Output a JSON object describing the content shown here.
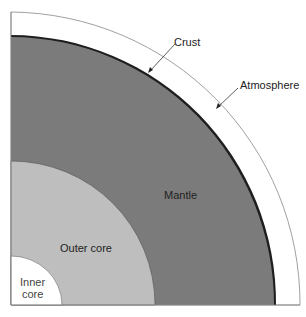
{
  "diagram": {
    "layers": [
      {
        "name": "atmosphere",
        "label": "Atmosphere",
        "color": "#ffffff"
      },
      {
        "name": "crust",
        "label": "Crust",
        "color": "#1a1a1a"
      },
      {
        "name": "mantle",
        "label": "Mantle",
        "color": "#7a7a7a"
      },
      {
        "name": "outer-core",
        "label": "Outer core",
        "color": "#bdbdbd"
      },
      {
        "name": "inner-core",
        "label_line1": "Inner",
        "label_line2": "core",
        "color": "#ffffff"
      }
    ]
  }
}
